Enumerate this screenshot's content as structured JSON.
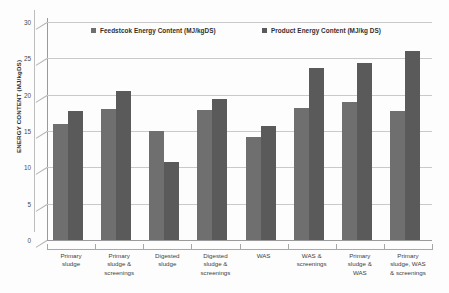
{
  "chart_data": {
    "type": "bar",
    "title": "",
    "xlabel": "",
    "ylabel": "ENERGY CONTENT (MJ/kgDS)",
    "ylim": [
      0,
      30
    ],
    "yticks": [
      0,
      5,
      10,
      15,
      20,
      25,
      30
    ],
    "grid": true,
    "legend_position": "top-inside",
    "categories": [
      "Primary sludge",
      "Primary sludge & screenings",
      "Digested sludge",
      "Digested sludge & screenings",
      "WAS",
      "WAS & screenings",
      "Primary sludge & WAS",
      "Primary sludge, WAS & screenings"
    ],
    "category_lines": [
      [
        "Primary",
        "sludge"
      ],
      [
        "Primary",
        "sludge &",
        "screenings"
      ],
      [
        "Digested",
        "sludge"
      ],
      [
        "Digested",
        "sludge &",
        "screenings"
      ],
      [
        "WAS"
      ],
      [
        "WAS &",
        "screenings"
      ],
      [
        "Primary",
        "sludge &",
        "WAS"
      ],
      [
        "Primary",
        "sludge, WAS",
        "& screenings"
      ]
    ],
    "series": [
      {
        "name": "Feedstcok Energy Content (MJ/kgDS)",
        "color": "#6f6f6f",
        "values": [
          16.0,
          18.0,
          15.0,
          17.9,
          14.2,
          18.2,
          19.0,
          17.7
        ]
      },
      {
        "name": "Product Energy Content (MJ/kg DS)",
        "color": "#5a5a5a",
        "values": [
          17.7,
          20.5,
          10.8,
          19.4,
          15.7,
          23.7,
          24.3,
          26.0
        ]
      }
    ]
  }
}
